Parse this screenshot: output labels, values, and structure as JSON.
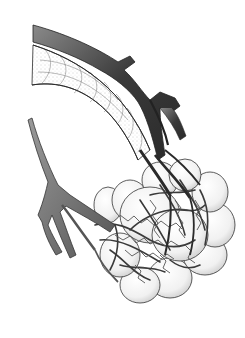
{
  "image": {
    "subject": "Anatomical illustration of pulmonary alveoli with capillary network",
    "style": "black-and-white pen and stipple drawing",
    "elements": [
      "bronchiole",
      "alveolar sac",
      "alveoli",
      "capillary network",
      "pulmonary artery branch",
      "pulmonary vein branch"
    ],
    "colors": {
      "background": "#ffffff",
      "dark_vessel": "#3a3a3a",
      "mid_vessel": "#6e6e6e",
      "outline": "#2a2a2a",
      "stipple": "#9a9a9a"
    }
  }
}
